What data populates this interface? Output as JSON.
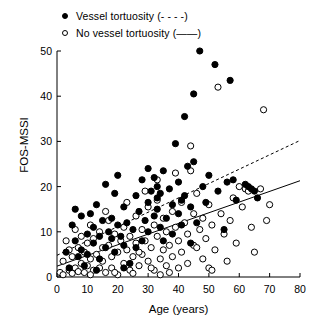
{
  "legend": {
    "items": [
      {
        "marker": "filled-circle-marker",
        "label": "Vessel tortuosity (- - - -)"
      },
      {
        "marker": "open-circle-marker",
        "label": "No vessel tortuosity (——)"
      }
    ]
  },
  "chart_data": {
    "type": "scatter",
    "title": "",
    "xlabel": "Age (years)",
    "ylabel": "FOS-MSSI",
    "xlim": [
      0,
      80
    ],
    "ylim": [
      0,
      50
    ],
    "xticks": [
      0,
      10,
      20,
      30,
      40,
      50,
      60,
      70,
      80
    ],
    "yticks": [
      0,
      10,
      20,
      30,
      40,
      50
    ],
    "grid": false,
    "legend_position": "above-plot-left",
    "series": [
      {
        "name": "Vessel tortuosity",
        "marker": "filled-circle",
        "fit_line_style": "dashed",
        "fit_line": {
          "x": [
            0,
            80
          ],
          "y": [
            4.8,
            30.2
          ]
        },
        "points": [
          [
            3,
            5.5
          ],
          [
            4,
            2.0
          ],
          [
            5,
            11.5
          ],
          [
            6,
            8.0
          ],
          [
            6,
            15.0
          ],
          [
            7,
            4.5
          ],
          [
            8,
            13.5
          ],
          [
            8,
            6.0
          ],
          [
            9,
            2.5
          ],
          [
            10,
            9.5
          ],
          [
            10,
            5.0
          ],
          [
            11,
            14.0
          ],
          [
            12,
            7.5
          ],
          [
            12,
            11.0
          ],
          [
            13,
            16.0
          ],
          [
            14,
            4.0
          ],
          [
            14,
            9.0
          ],
          [
            15,
            12.5
          ],
          [
            16,
            6.5
          ],
          [
            16,
            20.5
          ],
          [
            17,
            10.0
          ],
          [
            18,
            8.5
          ],
          [
            18,
            13.0
          ],
          [
            19,
            5.5
          ],
          [
            20,
            22.5
          ],
          [
            20,
            11.5
          ],
          [
            21,
            9.0
          ],
          [
            22,
            15.5
          ],
          [
            22,
            7.0
          ],
          [
            23,
            12.0
          ],
          [
            24,
            3.0
          ],
          [
            25,
            10.5
          ],
          [
            26,
            18.0
          ],
          [
            27,
            14.5
          ],
          [
            28,
            21.5
          ],
          [
            28,
            8.0
          ],
          [
            29,
            12.5
          ],
          [
            30,
            16.5
          ],
          [
            30,
            10.0
          ],
          [
            31,
            19.0
          ],
          [
            32,
            22.0
          ],
          [
            32,
            13.5
          ],
          [
            33,
            17.5
          ],
          [
            33,
            20.0
          ],
          [
            33,
            15.0
          ],
          [
            34,
            11.0
          ],
          [
            34,
            18.5
          ],
          [
            35,
            23.5
          ],
          [
            36,
            13.0
          ],
          [
            37,
            19.5
          ],
          [
            38,
            9.5
          ],
          [
            38,
            16.0
          ],
          [
            39,
            29.5
          ],
          [
            40,
            21.0
          ],
          [
            40,
            14.0
          ],
          [
            41,
            17.0
          ],
          [
            41,
            11.5
          ],
          [
            42,
            35.5
          ],
          [
            42,
            18.0
          ],
          [
            43,
            24.5
          ],
          [
            44,
            15.5
          ],
          [
            45,
            40.5
          ],
          [
            46,
            12.0
          ],
          [
            47,
            50.0
          ],
          [
            48,
            20.0
          ],
          [
            49,
            16.5
          ],
          [
            50,
            22.5
          ],
          [
            52,
            47.0
          ],
          [
            53,
            19.0
          ],
          [
            55,
            10.5
          ],
          [
            56,
            21.0
          ],
          [
            57,
            43.5
          ],
          [
            58,
            21.5
          ],
          [
            59,
            17.0
          ],
          [
            62,
            20.5
          ],
          [
            63,
            20.0
          ],
          [
            64,
            19.5
          ],
          [
            65,
            19.0
          ],
          [
            66,
            17.5
          ],
          [
            45,
            25.5
          ],
          [
            30,
            24.0
          ],
          [
            19,
            18.5
          ],
          [
            26,
            6.5
          ],
          [
            35,
            8.0
          ],
          [
            44,
            7.5
          ],
          [
            13,
            1.5
          ],
          [
            22,
            2.0
          ]
        ]
      },
      {
        "name": "No vessel tortuosity",
        "marker": "open-circle",
        "fit_line_style": "solid",
        "fit_line": {
          "x": [
            0,
            80
          ],
          "y": [
            2.4,
            21.3
          ]
        },
        "points": [
          [
            1,
            1.0
          ],
          [
            2,
            3.5
          ],
          [
            2,
            0.5
          ],
          [
            3,
            8.0
          ],
          [
            4,
            1.5
          ],
          [
            4,
            6.0
          ],
          [
            5,
            0.8
          ],
          [
            5,
            4.5
          ],
          [
            6,
            2.0
          ],
          [
            6,
            10.5
          ],
          [
            7,
            6.5
          ],
          [
            7,
            1.2
          ],
          [
            8,
            3.0
          ],
          [
            8,
            9.0
          ],
          [
            9,
            5.5
          ],
          [
            9,
            1.0
          ],
          [
            10,
            7.5
          ],
          [
            10,
            2.5
          ],
          [
            11,
            11.5
          ],
          [
            11,
            4.0
          ],
          [
            12,
            1.5
          ],
          [
            12,
            8.5
          ],
          [
            13,
            5.0
          ],
          [
            14,
            2.0
          ],
          [
            14,
            10.0
          ],
          [
            15,
            6.5
          ],
          [
            15,
            3.5
          ],
          [
            16,
            1.0
          ],
          [
            17,
            7.0
          ],
          [
            17,
            12.5
          ],
          [
            18,
            4.5
          ],
          [
            18,
            2.0
          ],
          [
            19,
            9.5
          ],
          [
            20,
            5.5
          ],
          [
            20,
            0.5
          ],
          [
            21,
            8.0
          ],
          [
            22,
            3.0
          ],
          [
            22,
            11.0
          ],
          [
            23,
            6.0
          ],
          [
            24,
            1.5
          ],
          [
            24,
            9.0
          ],
          [
            25,
            4.5
          ],
          [
            26,
            13.5
          ],
          [
            26,
            7.5
          ],
          [
            27,
            2.5
          ],
          [
            28,
            10.5
          ],
          [
            28,
            5.0
          ],
          [
            29,
            8.0
          ],
          [
            30,
            3.5
          ],
          [
            30,
            15.5
          ],
          [
            31,
            6.5
          ],
          [
            32,
            11.5
          ],
          [
            32,
            1.5
          ],
          [
            33,
            17.0
          ],
          [
            33,
            9.0
          ],
          [
            34,
            4.0
          ],
          [
            35,
            13.0
          ],
          [
            35,
            6.0
          ],
          [
            36,
            2.5
          ],
          [
            36,
            10.0
          ],
          [
            37,
            7.0
          ],
          [
            38,
            14.5
          ],
          [
            38,
            4.5
          ],
          [
            39,
            11.0
          ],
          [
            40,
            8.0
          ],
          [
            40,
            2.0
          ],
          [
            41,
            16.5
          ],
          [
            41,
            5.5
          ],
          [
            42,
            12.0
          ],
          [
            43,
            9.5
          ],
          [
            43,
            3.0
          ],
          [
            44,
            29.0
          ],
          [
            45,
            14.0
          ],
          [
            45,
            7.0
          ],
          [
            46,
            18.5
          ],
          [
            47,
            10.5
          ],
          [
            48,
            4.0
          ],
          [
            48,
            13.0
          ],
          [
            49,
            8.5
          ],
          [
            50,
            16.0
          ],
          [
            50,
            2.0
          ],
          [
            51,
            11.5
          ],
          [
            52,
            6.0
          ],
          [
            53,
            42.0
          ],
          [
            54,
            14.0
          ],
          [
            55,
            9.5
          ],
          [
            56,
            3.5
          ],
          [
            57,
            12.5
          ],
          [
            58,
            17.5
          ],
          [
            59,
            7.5
          ],
          [
            60,
            20.0
          ],
          [
            61,
            15.5
          ],
          [
            62,
            19.5
          ],
          [
            63,
            19.0
          ],
          [
            64,
            11.0
          ],
          [
            65,
            5.5
          ],
          [
            67,
            19.5
          ],
          [
            68,
            37.0
          ],
          [
            69,
            12.5
          ],
          [
            70,
            16.0
          ],
          [
            33,
            21.5
          ],
          [
            39,
            23.0
          ],
          [
            44,
            23.5
          ],
          [
            16,
            14.5
          ],
          [
            23,
            16.5
          ],
          [
            29,
            19.0
          ],
          [
            11,
            0.5
          ],
          [
            19,
            1.0
          ],
          [
            27,
            5.5
          ],
          [
            37,
            1.0
          ],
          [
            46,
            6.5
          ],
          [
            51,
            1.5
          ],
          [
            34,
            0.5
          ],
          [
            25,
            0.8
          ],
          [
            31,
            2.0
          ]
        ]
      }
    ]
  }
}
